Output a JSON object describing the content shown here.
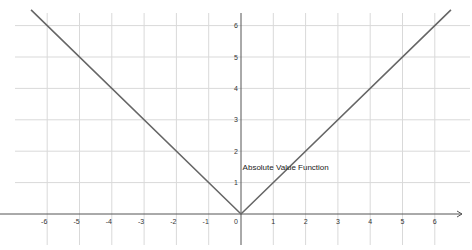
{
  "chart_data": {
    "type": "line",
    "title": "",
    "xlabel": "",
    "ylabel": "",
    "xlim": [
      -7,
      7
    ],
    "ylim": [
      -1,
      6.5
    ],
    "grid": true,
    "x_ticks": [
      -6,
      -5,
      -4,
      -3,
      -2,
      -1,
      0,
      1,
      2,
      3,
      4,
      5,
      6
    ],
    "y_ticks": [
      1,
      2,
      3,
      4,
      5,
      6
    ],
    "series": [
      {
        "name": "Absolute Value Function",
        "function": "y = |x|",
        "x": [
          -6.5,
          0,
          6.5
        ],
        "y": [
          6.5,
          0,
          6.5
        ]
      }
    ],
    "annotations": [
      {
        "text": "Absolute Value Function",
        "x": 0.05,
        "y": 1.5
      }
    ],
    "colors": {
      "line": "#666666",
      "grid": "#d9d9d9",
      "axis": "#555555"
    }
  }
}
